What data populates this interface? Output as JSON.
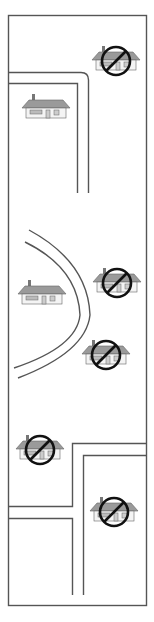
{
  "diagram": {
    "colors": {
      "line": "#555555",
      "roof": "#9a9a9a",
      "prohibition": "#111111",
      "background": "#ffffff"
    },
    "houses": [
      {
        "id": "house-1",
        "x": 94,
        "y": 42,
        "prohibited": true
      },
      {
        "id": "house-2",
        "x": 24,
        "y": 92,
        "prohibited": false
      },
      {
        "id": "house-3",
        "x": 20,
        "y": 278,
        "prohibited": false
      },
      {
        "id": "house-4",
        "x": 95,
        "y": 265,
        "prohibited": true
      },
      {
        "id": "house-5",
        "x": 84,
        "y": 337,
        "prohibited": true
      },
      {
        "id": "house-6",
        "x": 18,
        "y": 433,
        "prohibited": true
      },
      {
        "id": "house-7",
        "x": 92,
        "y": 495,
        "prohibited": true
      }
    ]
  }
}
